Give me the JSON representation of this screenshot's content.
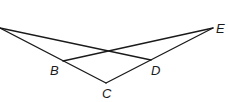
{
  "diagram": {
    "type": "geometry-figure",
    "points": {
      "A": {
        "x": 0,
        "y": 28,
        "label": ""
      },
      "B": {
        "x": 63,
        "y": 61,
        "label": "B"
      },
      "C": {
        "x": 106,
        "y": 83,
        "label": "C"
      },
      "D": {
        "x": 151,
        "y": 60,
        "label": "D"
      },
      "E": {
        "x": 213,
        "y": 28,
        "label": "E"
      }
    },
    "segments": [
      {
        "from": "A",
        "to": "D"
      },
      {
        "from": "A",
        "to": "C"
      },
      {
        "from": "B",
        "to": "E"
      },
      {
        "from": "C",
        "to": "E"
      }
    ],
    "labels": {
      "B": "B",
      "C": "C",
      "D": "D",
      "E": "E"
    },
    "line_color": "#1a1a1a",
    "background": "#ffffff"
  }
}
